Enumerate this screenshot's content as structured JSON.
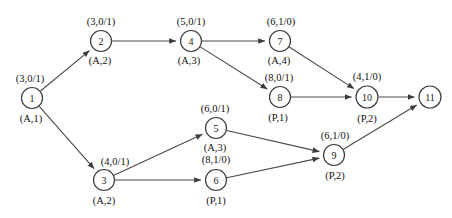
{
  "diagram": {
    "type": "directed-graph",
    "width": 452,
    "height": 218,
    "colors": {
      "background": "#ffffff",
      "edge": "#4a4a4a",
      "node_stroke": "#3d3d3d",
      "node_fill": "#ffffff",
      "text": "#111111"
    },
    "nodes": [
      {
        "id": "1",
        "x": 32,
        "y": 98,
        "r": 10.5,
        "label_above": "(3,0/1)",
        "label_below": "(A,1)",
        "above_dx": -2,
        "above_dy": -16,
        "below_dx": -1,
        "below_dy": 24
      },
      {
        "id": "2",
        "x": 101,
        "y": 41,
        "r": 10.5,
        "label_above": "(3,0/1)",
        "label_below": "(A,2)",
        "above_dx": 0,
        "above_dy": -16,
        "below_dx": -1,
        "below_dy": 23
      },
      {
        "id": "3",
        "x": 104,
        "y": 180,
        "r": 10.5,
        "label_above": "(4,0/1)",
        "label_below": "(A,2)",
        "above_dx": 11,
        "above_dy": -15,
        "below_dx": 0,
        "below_dy": 24
      },
      {
        "id": "4",
        "x": 191,
        "y": 41,
        "r": 10.5,
        "label_above": "(5,0/1)",
        "label_below": "(A,3)",
        "above_dx": 0,
        "above_dy": -16,
        "below_dx": -2,
        "below_dy": 23
      },
      {
        "id": "5",
        "x": 216,
        "y": 128,
        "r": 10.5,
        "label_above": "(6,0/1)",
        "label_below": "(A,3)",
        "above_dx": -1,
        "above_dy": -16,
        "below_dx": -1,
        "below_dy": 23
      },
      {
        "id": "6",
        "x": 216,
        "y": 180,
        "r": 10.5,
        "label_above": "(8,1/0)",
        "label_below": "(P,1)",
        "above_dx": 0,
        "above_dy": -17,
        "below_dx": 0,
        "below_dy": 24
      },
      {
        "id": "7",
        "x": 280,
        "y": 41,
        "r": 10.5,
        "label_above": "(6,1/0)",
        "label_below": "(A,4)",
        "above_dx": 1,
        "above_dy": -16,
        "below_dx": -1,
        "below_dy": 23
      },
      {
        "id": "8",
        "x": 280,
        "y": 97,
        "r": 10.5,
        "label_above": "(8,0/1)",
        "label_below": "(P,1)",
        "above_dx": -1,
        "above_dy": -16,
        "below_dx": -2,
        "below_dy": 24
      },
      {
        "id": "9",
        "x": 334,
        "y": 155,
        "r": 10.5,
        "label_above": "(6,1/0)",
        "label_below": "(P,2)",
        "above_dx": 1,
        "above_dy": -16,
        "below_dx": 1,
        "below_dy": 24
      },
      {
        "id": "10",
        "x": 367,
        "y": 97,
        "r": 11,
        "label_above": "(4,1/0)",
        "label_below": "(P,2)",
        "above_dx": 0,
        "above_dy": -17,
        "below_dx": 0,
        "below_dy": 25
      },
      {
        "id": "11",
        "x": 430,
        "y": 97,
        "r": 11,
        "label_above": "",
        "label_below": "",
        "above_dx": 0,
        "above_dy": -17,
        "below_dx": 0,
        "below_dy": 25
      }
    ],
    "edges": [
      {
        "from": "1",
        "to": "2"
      },
      {
        "from": "1",
        "to": "3"
      },
      {
        "from": "2",
        "to": "4"
      },
      {
        "from": "4",
        "to": "7"
      },
      {
        "from": "4",
        "to": "8"
      },
      {
        "from": "3",
        "to": "5"
      },
      {
        "from": "3",
        "to": "6"
      },
      {
        "from": "7",
        "to": "10"
      },
      {
        "from": "8",
        "to": "10"
      },
      {
        "from": "5",
        "to": "9"
      },
      {
        "from": "6",
        "to": "9"
      },
      {
        "from": "10",
        "to": "11"
      },
      {
        "from": "9",
        "to": "11"
      }
    ]
  }
}
